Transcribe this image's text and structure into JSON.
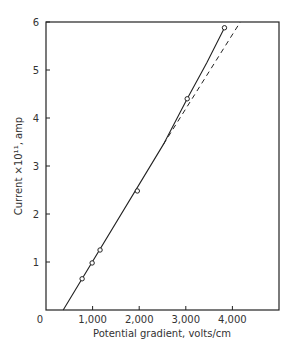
{
  "chart_data": {
    "type": "line",
    "title": "",
    "xlabel": "Potential gradient, volts/cm",
    "ylabel": "Current ×10¹¹, amp",
    "xlim": [
      0,
      5000
    ],
    "ylim": [
      0,
      6
    ],
    "x_ticks": [
      0,
      1000,
      2000,
      3000,
      4000
    ],
    "x_tick_labels": [
      "0",
      "1,000",
      "2,000",
      "3,000",
      "4,000"
    ],
    "y_ticks": [
      1,
      2,
      3,
      4,
      5,
      6
    ],
    "y_tick_labels": [
      "1",
      "2",
      "3",
      "4",
      "5",
      "6"
    ],
    "grid": false,
    "legend": null,
    "series": [
      {
        "name": "measured",
        "style": "solid line with open circle markers",
        "markers": [
          {
            "x": 775,
            "y": 0.65
          },
          {
            "x": 990,
            "y": 0.98
          },
          {
            "x": 1160,
            "y": 1.25
          },
          {
            "x": 1960,
            "y": 2.48
          },
          {
            "x": 3030,
            "y": 4.4
          },
          {
            "x": 3830,
            "y": 5.88
          }
        ],
        "curve": [
          {
            "x": 370,
            "y": 0.0
          },
          {
            "x": 2520,
            "y": 3.45
          },
          {
            "x": 3030,
            "y": 4.4
          },
          {
            "x": 3450,
            "y": 5.15
          },
          {
            "x": 3830,
            "y": 5.88
          }
        ]
      },
      {
        "name": "linear extrapolation",
        "style": "dashed line",
        "curve": [
          {
            "x": 2520,
            "y": 3.45
          },
          {
            "x": 4170,
            "y": 6.0
          }
        ]
      }
    ]
  }
}
